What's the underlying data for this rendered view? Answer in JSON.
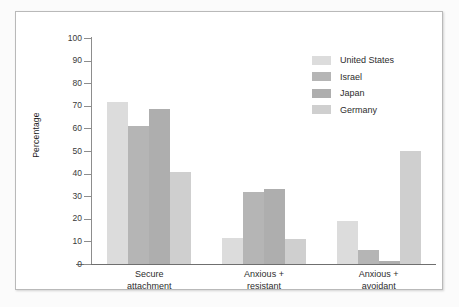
{
  "figure": {
    "background_color": "#fbfbfb",
    "panel_background": "#ffffff",
    "panel_border_color": "#b9b9b9",
    "axis_color": "#8d8d8d"
  },
  "chart_data": {
    "type": "bar",
    "title": "",
    "subtitle": "",
    "xlabel": "",
    "ylabel": "Percentage",
    "ylim": [
      0,
      100
    ],
    "yticks": [
      0,
      10,
      20,
      30,
      40,
      50,
      60,
      70,
      80,
      90,
      100
    ],
    "ytick_labels": [
      "0",
      "10",
      "20",
      "30",
      "40",
      "50",
      "60",
      "70",
      "80",
      "90",
      "100"
    ],
    "grid": false,
    "legend_position": "upper right",
    "categories": [
      "Secure\nattachment",
      "Anxious +\nresistant",
      "Anxious +\navoidant"
    ],
    "category_lines": [
      [
        "Secure",
        "attachment"
      ],
      [
        "Anxious +",
        "resistant"
      ],
      [
        "Anxious +",
        "avoidant"
      ]
    ],
    "series": [
      {
        "name": "United States",
        "color": "#dcdcdc",
        "values": [
          71.5,
          11.5,
          19
        ]
      },
      {
        "name": "Israel",
        "color": "#b5b5b5",
        "values": [
          61,
          32,
          6
        ]
      },
      {
        "name": "Japan",
        "color": "#aeaeae",
        "values": [
          68.5,
          33,
          1.2
        ]
      },
      {
        "name": "Germany",
        "color": "#cfcfcf",
        "values": [
          40.5,
          11,
          50
        ]
      }
    ]
  },
  "legend": {
    "items": [
      {
        "label": "United States",
        "color": "#dcdcdc"
      },
      {
        "label": "Israel",
        "color": "#b5b5b5"
      },
      {
        "label": "Japan",
        "color": "#aeaeae"
      },
      {
        "label": "Germany",
        "color": "#cfcfcf"
      }
    ]
  }
}
